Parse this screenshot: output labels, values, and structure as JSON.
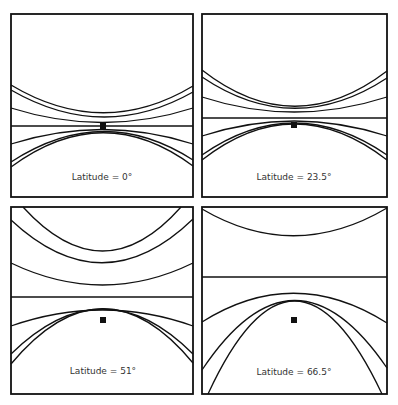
{
  "figure": {
    "panels": [
      {
        "label": "Latitude = 0°",
        "latitude": 0
      },
      {
        "label": "Latitude = 23.5°",
        "latitude": 23.5
      },
      {
        "label": "Latitude = 51°",
        "latitude": 51
      },
      {
        "label": "Latitude = 66.5°",
        "latitude": 66.5
      }
    ],
    "colors": {
      "stroke": "#111111",
      "background": "#ffffff",
      "label": "#333333"
    }
  }
}
